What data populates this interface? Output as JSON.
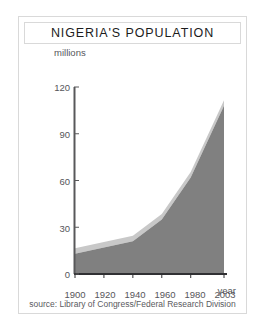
{
  "figure": {
    "title": "NIGERIA'S POPULATION",
    "year_axis_label": "year",
    "source": "source: Library of Congress/Federal Research Division"
  },
  "colors": {
    "area_fill": "#808080",
    "area_highlight": "#c8c8c8",
    "axis": "#58585a",
    "text": "#56565a",
    "title_text": "#1c1c1c",
    "panel_border": "#d9d9d9",
    "background": "#ffffff"
  },
  "chart_data": {
    "type": "area",
    "title": "NIGERIA'S POPULATION",
    "subtitle": "",
    "xlabel": "year",
    "ylabel": "millions",
    "x": [
      1900,
      1920,
      1940,
      1960,
      1980,
      2003
    ],
    "values": [
      13,
      17,
      21,
      35,
      62,
      108
    ],
    "series": [
      {
        "name": "Population (millions)",
        "values": [
          13,
          17,
          21,
          35,
          62,
          108
        ]
      }
    ],
    "xtick_labels": [
      "1900",
      "1920",
      "1940",
      "1960",
      "1980",
      "2003"
    ],
    "ytick_labels": [
      "0",
      "30",
      "60",
      "90",
      "120"
    ],
    "yticks": [
      0,
      30,
      60,
      90,
      120
    ],
    "xlim": [
      1900,
      2003
    ],
    "ylim": [
      0,
      120
    ],
    "grid": false,
    "legend": false,
    "annotations": [
      "millions",
      "year"
    ],
    "source": "source: Library of Congress/Federal Research Division"
  }
}
